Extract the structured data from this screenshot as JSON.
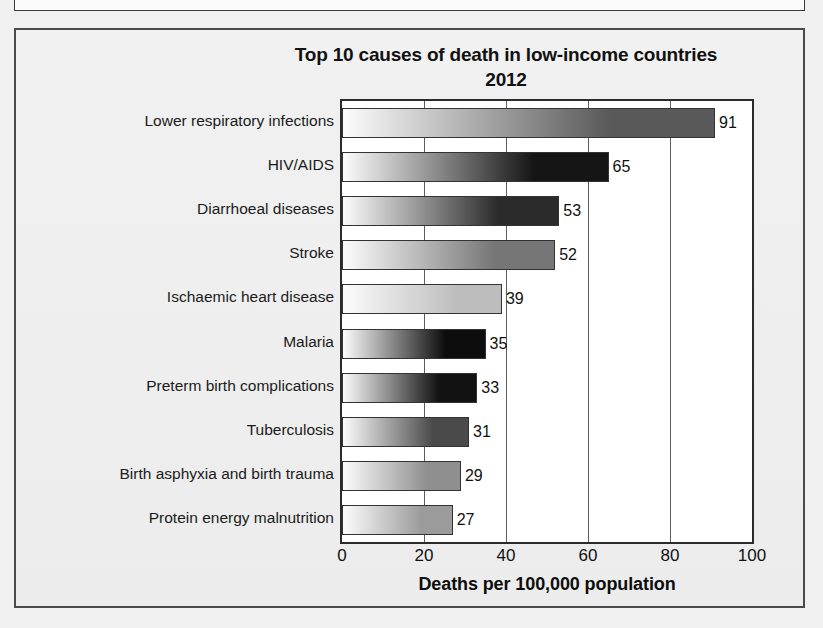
{
  "figure": {
    "title_line1": "Top 10 causes of death in low-income countries",
    "title_line2": "2012"
  },
  "chart_data": {
    "type": "bar",
    "orientation": "horizontal",
    "title": "Top 10 causes of death in low-income countries 2012",
    "xlabel": "Deaths per 100,000 population",
    "ylabel": "",
    "xlim": [
      0,
      100
    ],
    "xticks": [
      "0",
      "20",
      "40",
      "60",
      "80",
      "100"
    ],
    "gridlines": [
      20,
      40,
      60,
      80
    ],
    "grid": true,
    "legend": null,
    "categories": [
      "Lower respiratory infections",
      "HIV/AIDS",
      "Diarrhoeal diseases",
      "Stroke",
      "Ischaemic heart disease",
      "Malaria",
      "Preterm birth complications",
      "Tuberculosis",
      "Birth asphyxia and birth trauma",
      "Protein energy malnutrition"
    ],
    "values": [
      91,
      65,
      53,
      52,
      39,
      35,
      33,
      31,
      29,
      27
    ],
    "value_labels": [
      "91",
      "65",
      "53",
      "52",
      "39",
      "35",
      "33",
      "31",
      "29",
      "27"
    ],
    "bar_gradient_end_colors": [
      "#595959",
      "#151515",
      "#2b2b2b",
      "#767676",
      "#bdbdbd",
      "#0d0d0d",
      "#121212",
      "#4a4a4a",
      "#8f8f8f",
      "#9b9b9b"
    ],
    "bar_gradient_start_color": "#fcfcfc"
  }
}
